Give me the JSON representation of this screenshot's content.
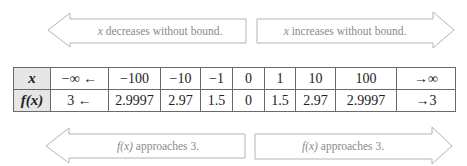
{
  "arrows": {
    "top_left": {
      "var": "x",
      "text": " decreases without bound.",
      "direction": "left"
    },
    "top_right": {
      "var": "x",
      "text": " increases without bound.",
      "direction": "right"
    },
    "bottom_left": {
      "var": "f(x)",
      "text": " approaches 3.",
      "direction": "left"
    },
    "bottom_right": {
      "var": "f(x)",
      "text": " approaches 3.",
      "direction": "right"
    }
  },
  "table": {
    "row_x": {
      "header": "x",
      "cells": [
        "−∞ ←",
        "−100",
        "−10",
        "−1",
        "0",
        "1",
        "10",
        "100",
        "→∞"
      ]
    },
    "row_fx": {
      "header": "f(x)",
      "cells": [
        "3 ←",
        "2.9997",
        "2.97",
        "1.5",
        "0",
        "1.5",
        "2.97",
        "2.9997",
        "→3"
      ]
    }
  },
  "colors": {
    "arrow_stroke": "#b4b4b4",
    "text_muted": "#8a8a8a",
    "header_bg": "#e6e6e6",
    "grid": "#6a6a6a"
  }
}
